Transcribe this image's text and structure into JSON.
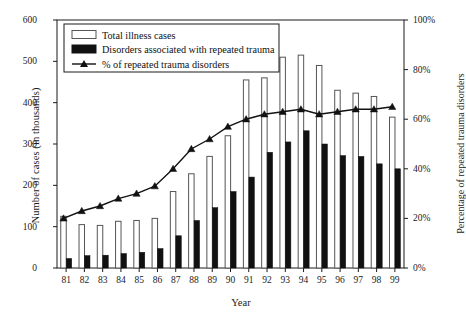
{
  "chart_data": {
    "type": "bar",
    "title": "",
    "xlabel": "Year",
    "ylabel": "Number of cases (in thousands)",
    "ylabel_right": "Percentage of repeated trauma disorders",
    "categories": [
      "81",
      "82",
      "83",
      "84",
      "85",
      "86",
      "87",
      "88",
      "89",
      "90",
      "91",
      "92",
      "93",
      "94",
      "95",
      "96",
      "97",
      "98",
      "99"
    ],
    "ylim": [
      0,
      600
    ],
    "ylim_right": [
      0,
      100
    ],
    "yticks": [
      0,
      100,
      200,
      300,
      400,
      500,
      600
    ],
    "yticks_right": [
      "0%",
      "20%",
      "40%",
      "60%",
      "80%",
      "100%"
    ],
    "ytick_right_values": [
      0,
      20,
      40,
      60,
      80,
      100
    ],
    "grid": false,
    "legend_position": "top-left",
    "series": [
      {
        "name": "Total illness cases",
        "type": "bar",
        "style": "outline",
        "axis": "left",
        "values": [
          125,
          105,
          103,
          113,
          115,
          120,
          185,
          228,
          270,
          320,
          455,
          460,
          510,
          515,
          490,
          430,
          423,
          415,
          365
        ]
      },
      {
        "name": "Disorders associated with repeated trauma",
        "type": "bar",
        "style": "filled",
        "axis": "left",
        "values": [
          23,
          30,
          31,
          35,
          38,
          47,
          78,
          115,
          146,
          185,
          220,
          280,
          305,
          332,
          300,
          272,
          270,
          252,
          240
        ]
      },
      {
        "name": "% of repeated trauma disorders",
        "type": "line",
        "marker": "triangle",
        "axis": "right",
        "values": [
          20,
          23,
          25,
          28,
          30,
          33,
          40,
          48,
          52,
          57,
          60,
          62,
          63,
          64,
          62,
          63,
          64,
          64,
          65
        ]
      }
    ]
  },
  "legend": {
    "items": [
      {
        "label": "Total illness cases",
        "swatch": "outline-bar-swatch"
      },
      {
        "label": "Disorders associated with repeated trauma",
        "swatch": "filled-bar-swatch"
      },
      {
        "label": "% of repeated trauma disorders",
        "swatch": "line-triangle-swatch"
      }
    ]
  },
  "colors": {
    "axis": "#1a1a1a",
    "bar_outline_fill": "#ffffff",
    "bar_outline_stroke": "#555555",
    "bar_filled": "#111111",
    "line": "#111111",
    "background": "#ffffff"
  }
}
